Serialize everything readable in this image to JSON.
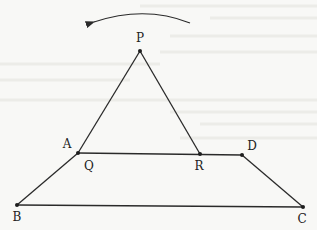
{
  "diagram": {
    "type": "geometry",
    "points": [
      {
        "id": "P",
        "label": "P",
        "x": 140,
        "y": 51,
        "lx": 140,
        "ly": 42
      },
      {
        "id": "A",
        "label": "A",
        "x": 78,
        "y": 153,
        "lx": 67,
        "ly": 148
      },
      {
        "id": "Q",
        "label": "Q",
        "x": 78,
        "y": 153,
        "lx": 89,
        "ly": 170
      },
      {
        "id": "R",
        "label": "R",
        "x": 200,
        "y": 154,
        "lx": 199,
        "ly": 170
      },
      {
        "id": "D",
        "label": "D",
        "x": 242,
        "y": 155,
        "lx": 252,
        "ly": 150
      },
      {
        "id": "B",
        "label": "B",
        "x": 17,
        "y": 205,
        "lx": 17,
        "ly": 221
      },
      {
        "id": "C",
        "label": "C",
        "x": 303,
        "y": 207,
        "lx": 302,
        "ly": 223
      }
    ],
    "segments": [
      [
        "P",
        "Q"
      ],
      [
        "P",
        "R"
      ],
      [
        "A",
        "D"
      ],
      [
        "A",
        "B"
      ],
      [
        "D",
        "C"
      ],
      [
        "B",
        "C"
      ]
    ],
    "rotation_arrow": {
      "direction": "counterclockwise",
      "from": [
        190,
        23
      ],
      "to": [
        92,
        22
      ]
    },
    "colors": {
      "stroke": "#2a2a2a",
      "background": "#f8f8f6"
    }
  }
}
